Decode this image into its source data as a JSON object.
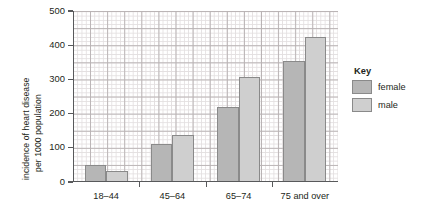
{
  "chart_data": {
    "type": "bar",
    "title": "",
    "xlabel": "",
    "ylabel": "incidence of heart disease per 1000 population",
    "ylabel_line1": "incidence of heart disease",
    "ylabel_line2": "per 1000 population",
    "categories": [
      "18–44",
      "45–64",
      "65–74",
      "75 and over"
    ],
    "series": [
      {
        "name": "female",
        "color": "#b6b6b6",
        "values": [
          50,
          112,
          218,
          353
        ]
      },
      {
        "name": "male",
        "color": "#cfcfcf",
        "values": [
          33,
          137,
          308,
          423
        ]
      }
    ],
    "ylim": [
      0,
      500
    ],
    "yticks": [
      0,
      100,
      200,
      300,
      400,
      500
    ],
    "ytick_labels": [
      "0",
      "100",
      "200",
      "300",
      "400",
      "500"
    ],
    "grid": true,
    "grid_style": "graph-paper",
    "legend_position": "right"
  },
  "legend": {
    "title": "Key",
    "entries": [
      {
        "label": "female",
        "color": "#b6b6b6"
      },
      {
        "label": "male",
        "color": "#cfcfcf"
      }
    ]
  },
  "colors": {
    "female": "#b6b6b6",
    "male": "#cfcfcf",
    "axis": "#58595b",
    "grid_fine": "#e3dfe0",
    "grid_major": "#b9b3b4",
    "text": "#231f20",
    "background": "#ffffff"
  }
}
